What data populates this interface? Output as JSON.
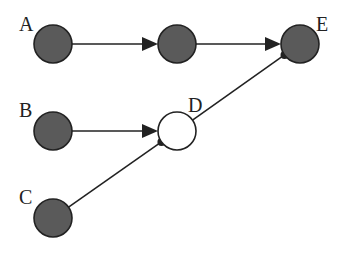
{
  "diagram": {
    "colors": {
      "filled": "#5a5a5a",
      "empty": "#ffffff",
      "stroke": "#222222",
      "edge": "#222222"
    },
    "nodes": [
      {
        "id": "A",
        "label": "A",
        "cx": 53,
        "cy": 44,
        "filled": true,
        "lx": 19,
        "ly": 31
      },
      {
        "id": "M",
        "label": "",
        "cx": 177,
        "cy": 44,
        "filled": true
      },
      {
        "id": "E",
        "label": "E",
        "cx": 300,
        "cy": 44,
        "filled": true,
        "lx": 316,
        "ly": 31
      },
      {
        "id": "B",
        "label": "B",
        "cx": 53,
        "cy": 131,
        "filled": true,
        "lx": 19,
        "ly": 117
      },
      {
        "id": "D",
        "label": "D",
        "cx": 177,
        "cy": 131,
        "filled": false,
        "lx": 188,
        "ly": 112
      },
      {
        "id": "C",
        "label": "C",
        "cx": 53,
        "cy": 218,
        "filled": true,
        "lx": 19,
        "ly": 204
      }
    ],
    "edges": [
      {
        "from": "A",
        "to": "M",
        "type": "arrow"
      },
      {
        "from": "M",
        "to": "E",
        "type": "arrow"
      },
      {
        "from": "B",
        "to": "D",
        "type": "arrow"
      },
      {
        "from": "C",
        "to": "D",
        "type": "dot"
      },
      {
        "from": "D",
        "to": "E",
        "type": "dot"
      }
    ]
  }
}
